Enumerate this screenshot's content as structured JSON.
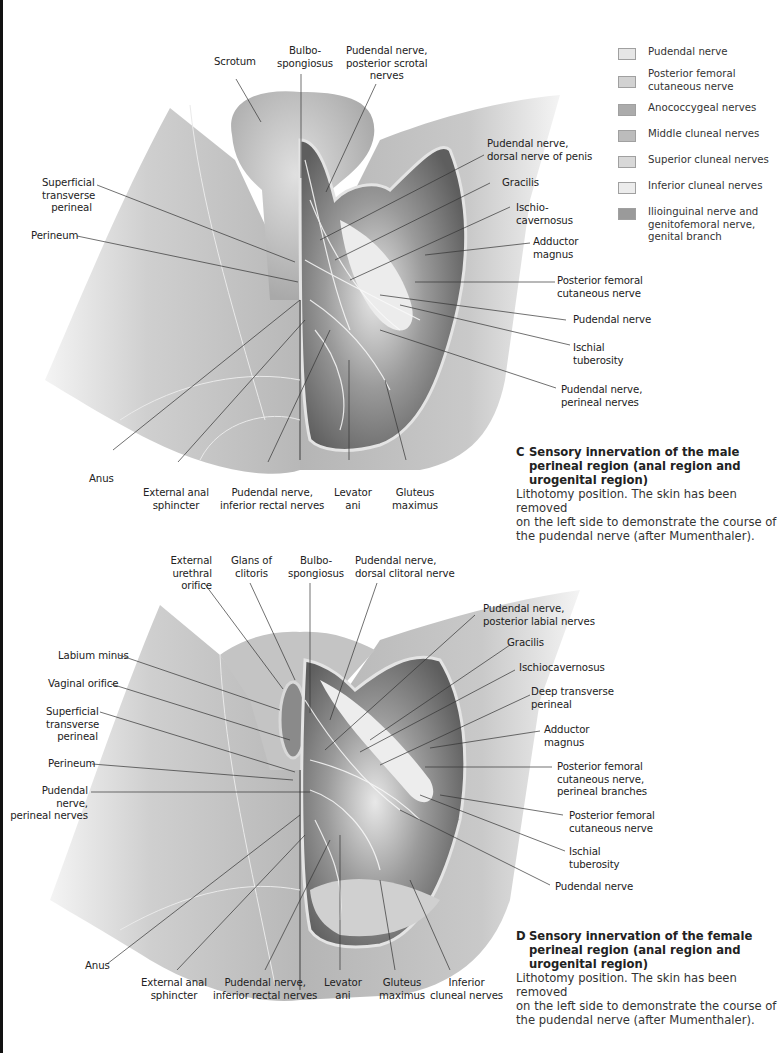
{
  "legend": {
    "items": [
      {
        "label": "Pudendal nerve",
        "color": "#e6e6e6"
      },
      {
        "label": "Posterior femoral\ncutaneous nerve",
        "color": "#d2d2d2"
      },
      {
        "label": "Anococcygeal nerves",
        "color": "#ababab"
      },
      {
        "label": "Middle cluneal nerves",
        "color": "#bcbcbc"
      },
      {
        "label": "Superior cluneal nerves",
        "color": "#d8d8d8"
      },
      {
        "label": "Inferior cluneal nerves",
        "color": "#ececec"
      },
      {
        "label": "Ilioinguinal nerve and\ngenitofemoral nerve,\ngenital branch",
        "color": "#9a9a9a"
      }
    ]
  },
  "figure_c": {
    "labels": {
      "scrotum": "Scrotum",
      "bulbospongiosus": "Bulbo-\nspongiosus",
      "pudendal_posterior_scrotal": "Pudendal nerve,\nposterior scrotal\nnerves",
      "pudendal_dorsal_penis": "Pudendal nerve,\ndorsal nerve of penis",
      "gracilis": "Gracilis",
      "ischiocavernosus": "Ischio-\ncavernosus",
      "adductor_magnus": "Adductor\nmagnus",
      "posterior_femoral_cutaneous": "Posterior femoral\ncutaneous nerve",
      "pudendal_nerve": "Pudendal nerve",
      "ischial_tuberosity": "Ischial\ntuberosity",
      "pudendal_perineal": "Pudendal nerve,\nperineal nerves",
      "superficial_transverse_perineal": "Superficial\ntransverse\nperineal",
      "perineum": "Perineum",
      "anus": "Anus",
      "external_anal_sphincter": "External anal\nsphincter",
      "pudendal_inferior_rectal": "Pudendal nerve,\ninferior rectal nerves",
      "levator_ani": "Levator\nani",
      "gluteus_maximus": "Gluteus\nmaximus"
    },
    "caption": {
      "letter": "C",
      "title": "Sensory innervation of the male\nperineal region (anal region and\nurogenital region)",
      "body": "Lithotomy position. The skin has been removed\non the left side to demonstrate the course of\nthe pudendal nerve (after Mumenthaler)."
    }
  },
  "figure_d": {
    "labels": {
      "external_urethral_orifice": "External\nurethral orifice",
      "glans_clitoris": "Glans of\nclitoris",
      "bulbospongiosus": "Bulbo-\nspongiosus",
      "pudendal_dorsal_clitoral": "Pudendal nerve,\ndorsal clitoral nerve",
      "pudendal_posterior_labial": "Pudendal nerve,\nposterior labial nerves",
      "gracilis": "Gracilis",
      "ischiocavernosus": "Ischiocavernosus",
      "deep_transverse_perineal": "Deep transverse\nperineal",
      "adductor_magnus": "Adductor\nmagnus",
      "posterior_femoral_perineal_branches": "Posterior femoral\ncutaneous nerve,\nperineal branches",
      "posterior_femoral_cutaneous": "Posterior femoral\ncutaneous nerve",
      "ischial_tuberosity": "Ischial\ntuberosity",
      "pudendal_nerve": "Pudendal nerve",
      "labium_minus": "Labium minus",
      "vaginal_orifice": "Vaginal orifice",
      "superficial_transverse_perineal": "Superficial\ntransverse\nperineal",
      "perineum": "Perineum",
      "pudendal_perineal": "Pudendal nerve,\nperineal nerves",
      "anus": "Anus",
      "external_anal_sphincter": "External anal\nsphincter",
      "pudendal_inferior_rectal": "Pudendal nerve,\ninferior rectal nerves",
      "levator_ani": "Levator\nani",
      "gluteus_maximus": "Gluteus\nmaximus",
      "inferior_cluneal": "Inferior\ncluneal nerves"
    },
    "caption": {
      "letter": "D",
      "title": "Sensory innervation of the female\nperineal region (anal region and\nurogenital region)",
      "body": "Lithotomy position. The skin has been removed\non the left side to demonstrate the course of\nthe pudendal nerve (after Mumenthaler)."
    }
  }
}
